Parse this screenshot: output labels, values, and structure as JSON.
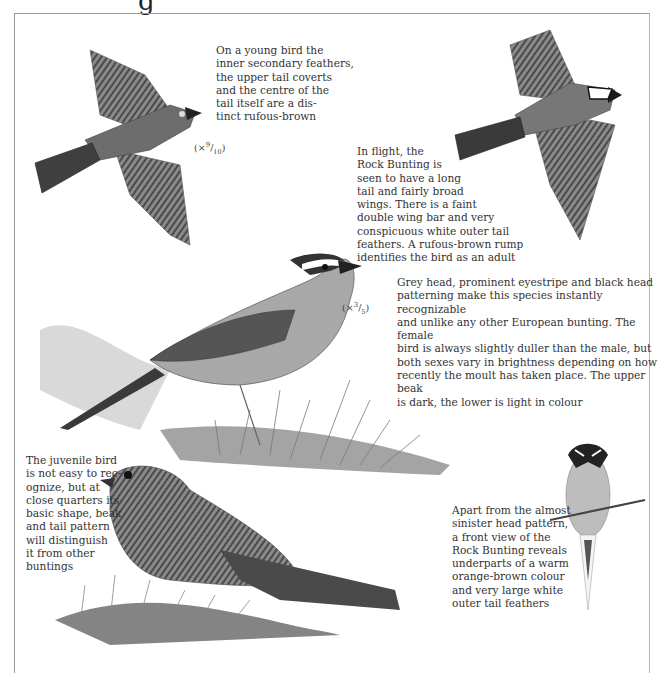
{
  "header": {
    "title_fragment": "g"
  },
  "illustrations": [
    {
      "id": "juvenile-flight",
      "scale": {
        "prefix": "(×",
        "num": "9",
        "den": "10",
        "suffix": ")"
      }
    },
    {
      "id": "adult-flight"
    },
    {
      "id": "adult-perched-side",
      "scale": {
        "prefix": "(×",
        "num": "3",
        "den": "5",
        "suffix": ")"
      }
    },
    {
      "id": "juvenile-perched"
    },
    {
      "id": "adult-front-view"
    }
  ],
  "captions": {
    "juvenile_flight": "On a young bird the\ninner secondary feathers,\nthe upper tail coverts\nand the centre of the\ntail itself are a dis-\ntinct rufous-brown",
    "adult_flight": "In flight, the\nRock Bunting is\nseen to have a long\ntail and fairly broad\nwings. There is a faint\ndouble wing bar and very\nconspicuous white outer tail\nfeathers. A rufous-brown rump\nidentifies the bird as an adult",
    "adult_head": "Grey head, prominent eyestripe and black head\npatterning make this species instantly recognizable\nand unlike any other European bunting. The female\nbird is always slightly duller than the male, but\nboth sexes vary in brightness depending on how\nrecently the moult has taken place. The upper beak\nis dark, the lower is light in colour",
    "juvenile": "The juvenile bird\nis not easy to rec-\nognize, but at\nclose quarters its\nbasic shape, beak\nand tail pattern\nwill distinguish\nit from other\nbuntings",
    "front_view": "Apart from the almost\nsinister head pattern,\na front view of the\nRock Bunting reveals\nunderparts of a warm\norange-brown colour\nand very large white\nouter tail feathers"
  }
}
